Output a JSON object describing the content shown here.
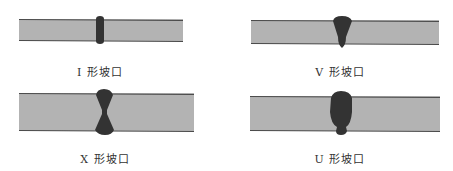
{
  "colors": {
    "plate_fill": "#b3b3b3",
    "plate_edge": "#5a5a5a",
    "weld_fill": "#333333",
    "label_text": "#333333",
    "background": "#ffffff"
  },
  "panels": [
    {
      "id": "i-groove",
      "label": "I 形坡口",
      "groove_type": "I"
    },
    {
      "id": "v-groove",
      "label": "V 形坡口",
      "groove_type": "V"
    },
    {
      "id": "x-groove",
      "label": "X 形坡口",
      "groove_type": "X"
    },
    {
      "id": "u-groove",
      "label": "U 形坡口",
      "groove_type": "U"
    }
  ]
}
